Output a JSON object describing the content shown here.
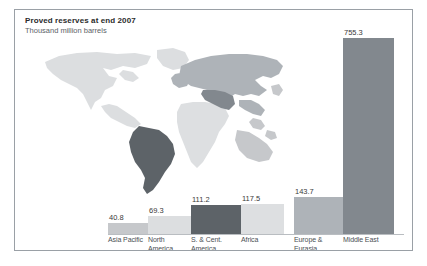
{
  "figure": {
    "title": "Proved reserves at end 2007",
    "subtitle": "Thousand million barrels",
    "border_color": "#9aa0a6",
    "background": "#ffffff"
  },
  "chart_data": {
    "type": "bar",
    "title": "Proved reserves at end 2007",
    "subtitle": "Thousand million barrels",
    "xlabel": "",
    "ylabel": "Thousand million barrels",
    "ylim": [
      0,
      755.3
    ],
    "grid": false,
    "legend": "none",
    "categories": [
      "Asia Pacific",
      "North America",
      "S. & Cent. America",
      "Africa",
      "Europe & Eurasia",
      "Middle East"
    ],
    "values": [
      40.8,
      69.3,
      111.2,
      117.5,
      143.7,
      755.3
    ],
    "value_labels": [
      "40.8",
      "69.3",
      "111.2",
      "117.5",
      "143.7",
      "755.3"
    ],
    "bar_colors": [
      "#c6c8cb",
      "#dcdee0",
      "#5d6368",
      "#dddfe1",
      "#aeb3b8",
      "#82888e"
    ]
  },
  "bars": [
    {
      "label_lines": [
        "Asia Pacific"
      ],
      "value_label": "40.8",
      "color": "#c6c8cb"
    },
    {
      "label_lines": [
        "North",
        "America"
      ],
      "value_label": "69.3",
      "color": "#dcdee0"
    },
    {
      "label_lines": [
        "S. & Cent.",
        "America"
      ],
      "value_label": "111.2",
      "color": "#5d6368"
    },
    {
      "label_lines": [
        "Africa"
      ],
      "value_label": "117.5",
      "color": "#dddfe1"
    },
    {
      "label_lines": [
        "Europe &",
        "Eurasia"
      ],
      "value_label": "143.7",
      "color": "#aeb3b8"
    },
    {
      "label_lines": [
        "Middle East"
      ],
      "value_label": "755.3",
      "color": "#82888e"
    }
  ],
  "map": {
    "region_colors": {
      "north_america": "#dcdee0",
      "south_america": "#5d6368",
      "africa": "#dddfe1",
      "europe_asia": "#aeb3b8",
      "middle_east": "#82888e",
      "asia_pacific": "#c6c8cb"
    }
  }
}
